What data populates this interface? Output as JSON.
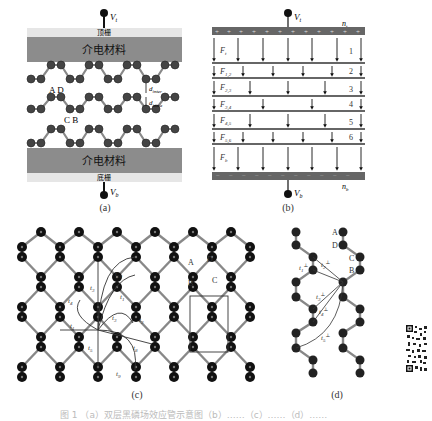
{
  "figure": {
    "panel_a": {
      "label": "(a)",
      "top_voltage": "V",
      "top_voltage_sub": "t",
      "top_gate": "顶栅",
      "dielectric_top": "介电材料",
      "dielectric_bottom": "介电材料",
      "bottom_gate": "底栅",
      "bottom_voltage": "V",
      "bottom_voltage_sub": "b",
      "site_labels_top": "A D",
      "site_labels_bottom": "C B",
      "d_inter": "d",
      "d_inter_sub": "inter",
      "d_intra": "d",
      "d_intra_sub": "intra"
    },
    "panel_b": {
      "label": "(b)",
      "top_voltage": "V",
      "top_voltage_sub": "t",
      "bottom_voltage": "V",
      "bottom_voltage_sub": "b",
      "top_charge": "n",
      "top_charge_sub": "t",
      "bottom_charge": "n",
      "bottom_charge_sub": "b",
      "fields": [
        {
          "name": "F",
          "sub": "t"
        },
        {
          "name": "F",
          "sub": "1,2"
        },
        {
          "name": "F",
          "sub": "2,3"
        },
        {
          "name": "F",
          "sub": "3,4"
        },
        {
          "name": "F",
          "sub": "4,5"
        },
        {
          "name": "F",
          "sub": "5,6"
        },
        {
          "name": "F",
          "sub": "b"
        }
      ],
      "layers": [
        "1",
        "2",
        "3",
        "4",
        "5",
        "6"
      ]
    },
    "panel_c": {
      "label": "(c)",
      "site_labels": [
        "A",
        "D",
        "B",
        "C"
      ],
      "hoppings": [
        "t1",
        "t2",
        "t3",
        "t4",
        "t5",
        "t6",
        "t7",
        "t8",
        "t9",
        "t10"
      ]
    },
    "panel_d": {
      "label": "(d)",
      "site_labels": [
        "A",
        "D",
        "C",
        "B"
      ],
      "hoppings": [
        "t1⊥",
        "t2⊥",
        "t3⊥",
        "t4⊥",
        "t5⊥"
      ]
    },
    "caption": "图 1 （a）双层黑磷场效应管示意图（b）……（c）……（d）……"
  }
}
